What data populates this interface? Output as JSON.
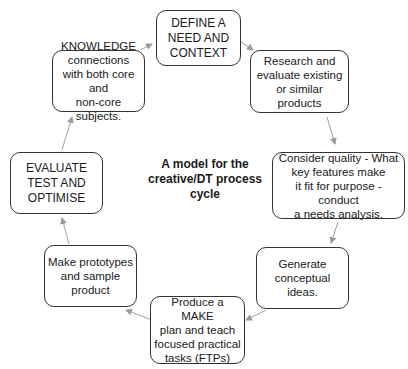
{
  "diagram": {
    "title": "A model for the\ncreative/DT process\ncycle",
    "nodes": [
      {
        "id": "define",
        "label": "DEFINE A\nNEED AND\nCONTEXT"
      },
      {
        "id": "research",
        "label": "Research and\nevaluate existing\nor similar products"
      },
      {
        "id": "quality",
        "label": "Consider quality - What\nkey features make\nit fit for purpose - conduct\na needs analysis."
      },
      {
        "id": "generate",
        "label": "Generate\nconceptual\nideas."
      },
      {
        "id": "make_plan",
        "label": "Produce a MAKE\nplan and teach\nfocused practical\ntasks (FTPs)"
      },
      {
        "id": "prototypes",
        "label": "Make prototypes\nand sample\nproduct"
      },
      {
        "id": "evaluate",
        "label": "EVALUATE\nTEST AND\nOPTIMISE"
      },
      {
        "id": "knowledge",
        "label": "KNOWLEDGE\nconnections\nwith both core and\nnon-core subjects."
      }
    ],
    "edges": [
      [
        "define",
        "research"
      ],
      [
        "research",
        "quality"
      ],
      [
        "quality",
        "generate"
      ],
      [
        "generate",
        "make_plan"
      ],
      [
        "make_plan",
        "prototypes"
      ],
      [
        "prototypes",
        "evaluate"
      ],
      [
        "evaluate",
        "knowledge"
      ],
      [
        "knowledge",
        "define"
      ]
    ],
    "colors": {
      "border": "#333333",
      "arrow": "#9a9a9a",
      "text": "#1a1a1a"
    }
  }
}
